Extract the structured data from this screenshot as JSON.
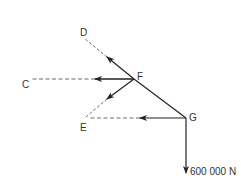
{
  "diagram": {
    "type": "free-body / force diagram",
    "nodes": {
      "F": {
        "label": "F",
        "x": 134,
        "y": 79
      },
      "G": {
        "label": "G",
        "x": 186,
        "y": 118
      }
    },
    "reference_points": {
      "D": {
        "label": "D",
        "x": 84,
        "y": 38
      },
      "C": {
        "label": "C",
        "x": 32,
        "y": 79
      },
      "E": {
        "label": "E",
        "x": 85,
        "y": 118
      }
    },
    "members": [
      {
        "from": "F",
        "to": "G",
        "style": "solid"
      },
      {
        "from": "F",
        "to": "D",
        "style": "solid+dashed",
        "arrow": "toward D"
      },
      {
        "from": "F",
        "to": "C",
        "style": "solid+dashed",
        "arrow": "toward C"
      },
      {
        "from": "F",
        "to": "E",
        "style": "solid+dashed",
        "arrow": "toward E"
      },
      {
        "from": "G",
        "to": "E",
        "style": "solid+dashed",
        "arrow": "toward E"
      }
    ],
    "external_load": {
      "at": "G",
      "direction": "down",
      "label": "600 000 N"
    },
    "colors": {
      "line": "#222222",
      "text": "#333333"
    }
  }
}
